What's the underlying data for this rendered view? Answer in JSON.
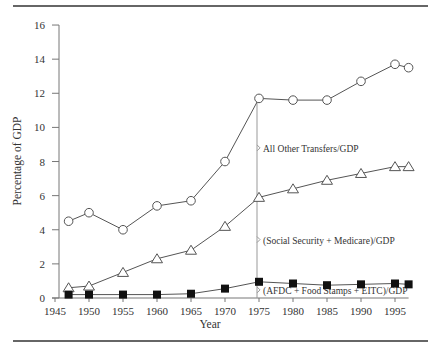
{
  "chart_data": {
    "type": "line",
    "title": "",
    "xlabel": "Year",
    "ylabel": "Percentage of GDP",
    "xlim": [
      1945,
      1997
    ],
    "ylim": [
      0,
      16
    ],
    "x_ticks": [
      1945,
      1950,
      1955,
      1960,
      1965,
      1970,
      1975,
      1980,
      1985,
      1990,
      1995
    ],
    "y_ticks": [
      0,
      2,
      4,
      6,
      8,
      10,
      12,
      14,
      16
    ],
    "grid": false,
    "x": [
      1947,
      1950,
      1955,
      1960,
      1965,
      1970,
      1975,
      1980,
      1985,
      1990,
      1995,
      1997
    ],
    "series": [
      {
        "name": "Total transfers/GDP",
        "marker": "circle-open",
        "values": [
          4.5,
          5.0,
          4.0,
          5.4,
          5.7,
          8.0,
          11.7,
          11.6,
          11.6,
          12.7,
          13.7,
          13.5
        ]
      },
      {
        "name": "(Social Security + Medicare + AFDC + Food Stamps + EITC)/GDP",
        "marker": "triangle-open",
        "values": [
          0.6,
          0.7,
          1.5,
          2.3,
          2.8,
          4.2,
          5.9,
          6.4,
          6.9,
          7.3,
          7.7,
          7.7
        ]
      },
      {
        "name": "(AFDC + Food Stamps + EITC)/GDP",
        "marker": "square-filled",
        "values": [
          0.2,
          0.2,
          0.2,
          0.2,
          0.25,
          0.55,
          0.95,
          0.85,
          0.75,
          0.8,
          0.85,
          0.8
        ]
      }
    ],
    "annotations": [
      {
        "text": "All Other Transfers/GDP",
        "bracket_year": 1975,
        "from": 5.9,
        "to": 11.7
      },
      {
        "text": "(Social Security + Medicare)/GDP",
        "bracket_year": 1975,
        "from": 0.95,
        "to": 5.9
      },
      {
        "text": "(AFDC + Food Stamps + EITC)/GDP",
        "bracket_year": 1975,
        "from": 0,
        "to": 0.95
      }
    ]
  }
}
